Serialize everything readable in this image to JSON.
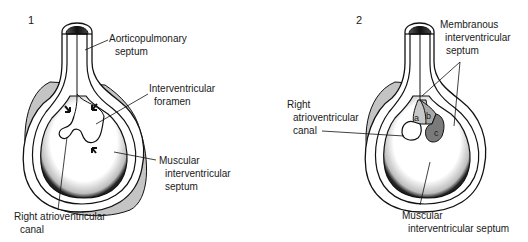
{
  "figures": [
    {
      "number": "1",
      "labels": {
        "aorticopulmonary_line1": "Aorticopulmonary",
        "aorticopulmonary_line2": "septum",
        "interventricular_foramen_line1": "Interventricular",
        "interventricular_foramen_line2": "foramen",
        "muscular_line1": "Muscular",
        "muscular_line2": "interventricular",
        "muscular_line3": "septum",
        "right_av_line1": "Right atrioventricular",
        "right_av_line2": "canal"
      }
    },
    {
      "number": "2",
      "labels": {
        "membranous_line1": "Membranous",
        "membranous_line2": "interventricular",
        "membranous_line3": "septum",
        "right_av_line1": "Right",
        "right_av_line2": "atrioventricular",
        "right_av_line3": "canal",
        "muscular_line1": "Muscular",
        "muscular_line2": "interventricular septum",
        "region_a": "a",
        "region_b": "b",
        "region_c": "c"
      }
    }
  ],
  "colors": {
    "outline": "#111111",
    "gray_shell": "#c4c4c4",
    "dark_cap": "#2a2a2a",
    "region_a": "#c8c8c8",
    "region_b": "#a8a8a8",
    "region_c": "#7a7a7a"
  }
}
